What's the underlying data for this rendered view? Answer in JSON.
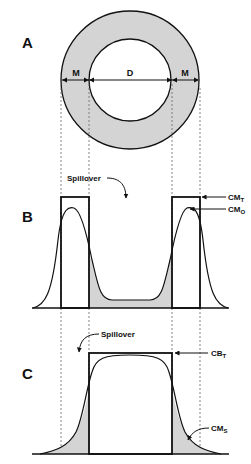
{
  "panels": {
    "a": {
      "label": "A",
      "segments": {
        "left": "M",
        "center": "D",
        "right": "M"
      }
    },
    "b": {
      "label": "B",
      "annotation": "Spillover",
      "curves": {
        "true": "CM",
        "true_sub": "T",
        "observed": "CM",
        "observed_sub": "O"
      }
    },
    "c": {
      "label": "C",
      "annotation": "Spillover",
      "curves": {
        "true": "CB",
        "true_sub": "T",
        "spill": "CM",
        "spill_sub": "S"
      }
    }
  },
  "colors": {
    "stroke": "#111111",
    "fill": "#d4d4d4",
    "background": "#ffffff"
  }
}
